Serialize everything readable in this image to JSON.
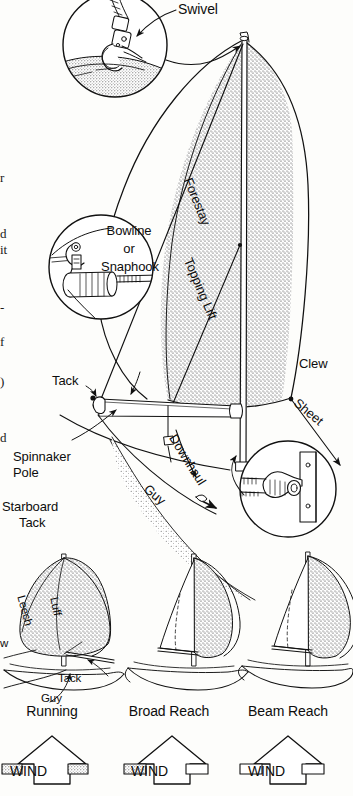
{
  "figure": {
    "background": "#fdfdfb",
    "ink": "#101010",
    "sail_fill": "#ffffff",
    "sail_shade": "stipple"
  },
  "callouts": {
    "swivel": "Swivel",
    "bowline_or_snaphook": "Bowline\nor\nSnaphook",
    "forestay": "Forestay",
    "topping_lift": "Topping Lift",
    "clew": "Clew",
    "sheet": "Sheet",
    "tack": "Tack",
    "spinnaker_pole": "Spinnaker\nPole",
    "downhaul": "Downhaul",
    "guy": "Guy",
    "starboard_tack": "Starboard\nTack"
  },
  "bowline_lines": [
    "Bowline",
    "or",
    "Snaphook"
  ],
  "spinnaker_pole_lines": [
    "Spinnaker",
    "Pole"
  ],
  "starboard_tack_lines": [
    "Starboard",
    "Tack"
  ],
  "small_boats": [
    {
      "name": "Running",
      "label": "Running",
      "wind_label": "WIND",
      "sail_labels": [
        "Leech",
        "Luff",
        "Tack",
        "Guy",
        "w"
      ]
    },
    {
      "name": "Broad Reach",
      "label": "Broad Reach",
      "wind_label": "WIND",
      "sail_labels": []
    },
    {
      "name": "Beam Reach",
      "label": "Beam Reach",
      "wind_label": "WIND",
      "sail_labels": []
    }
  ],
  "small_boat_inline_labels": {
    "leech": "Leech",
    "luff": "Luff",
    "tack": "Tack",
    "guy": "Guy",
    "clew_cut": "w"
  },
  "page_edge_fragments": [
    "r",
    "d",
    "it",
    "-",
    "f",
    ")",
    "d"
  ]
}
